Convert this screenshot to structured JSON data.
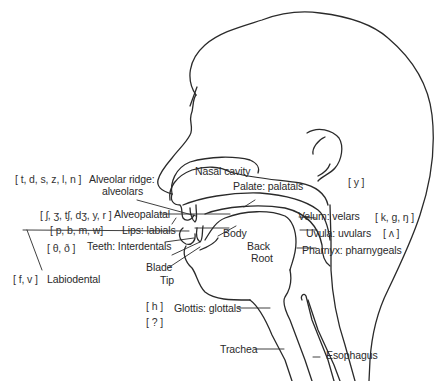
{
  "diagram": {
    "type": "sagittal-section-vocal-tract",
    "stroke_color": "#2a2a2a",
    "background": "#ffffff",
    "places": [
      {
        "key": "nasal",
        "label": "Nasal cavity",
        "ipa": ""
      },
      {
        "key": "alveolar",
        "label": "Alveolar ridge:",
        "label2": "alveolars",
        "ipa": "[ t, d, s, z, l, n ]"
      },
      {
        "key": "palatal",
        "label": "Palate: palatals",
        "ipa": "[ y ]"
      },
      {
        "key": "alveopalatal",
        "label": "Alveopalatal",
        "ipa": "[ ʃ, ʒ, tʃ, dʒ, y, r ]"
      },
      {
        "key": "velar",
        "label": "Velum: velars",
        "ipa": "[ k, g, ŋ ]"
      },
      {
        "key": "uvular",
        "label": "Uvula: uvulars",
        "ipa": "[ ʌ ]"
      },
      {
        "key": "labial",
        "label": "Lips: labials",
        "ipa": "[ p, b, m, w]"
      },
      {
        "key": "interdental",
        "label": "Teeth: Interdentals",
        "ipa": "[ θ, ð ]"
      },
      {
        "key": "labiodental",
        "label": "Labiodental",
        "ipa": "[ f, v ]"
      },
      {
        "key": "pharyngeal",
        "label": "Pharnyx: pharnygeals",
        "ipa": ""
      },
      {
        "key": "glottal",
        "label": "Glottis: glottals",
        "ipa": "[ h ]",
        "ipa2": "[ ? ]"
      }
    ],
    "tongue_parts": {
      "body": "Body",
      "back": "Back",
      "root": "Root",
      "blade": "Blade",
      "tip": "Tip"
    },
    "tubes": {
      "trachea": "Trachea",
      "esophagus": "Esophagus"
    }
  }
}
